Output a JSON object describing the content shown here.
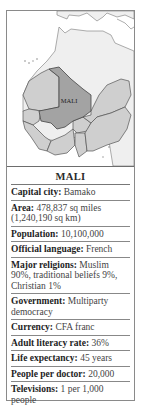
{
  "map": {
    "label": "MALI",
    "colors": {
      "sea": "#ffffff",
      "land_other": "#efefef",
      "west_africa": "#cfcfcf",
      "highlight": "#a3a3a3",
      "border": "#555555"
    }
  },
  "facts": {
    "title": "MALI",
    "rows": [
      {
        "label": "Capital city:",
        "value": "Bamako"
      },
      {
        "label": "Area:",
        "value": "478,837 sq miles (1,240,190 sq km)"
      },
      {
        "label": "Population:",
        "value": "10,100,000"
      },
      {
        "label": "Official language:",
        "value": "French"
      },
      {
        "label": "Major religions:",
        "value": "Muslim 90%, traditional beliefs 9%, Christian 1%"
      },
      {
        "label": "Government:",
        "value": "Multiparty democracy"
      },
      {
        "label": "Currency:",
        "value": "CFA franc"
      },
      {
        "label": "Adult literacy rate:",
        "value": "36%"
      },
      {
        "label": "Life expectancy:",
        "value": "45 years"
      },
      {
        "label": "People per doctor:",
        "value": "20,000"
      },
      {
        "label": "Televisions:",
        "value": "1 per 1,000 people"
      }
    ]
  }
}
